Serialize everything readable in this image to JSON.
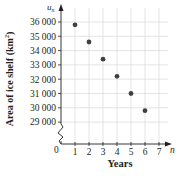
{
  "chart_data": {
    "type": "scatter",
    "title": "",
    "xlabel": "Years",
    "ylabel": "Area of ice shelf (km²)",
    "x_axis_symbol": "n",
    "y_axis_symbol": "u_n",
    "x": [
      1,
      2,
      3,
      4,
      5,
      6
    ],
    "values": [
      35800,
      34600,
      33400,
      32200,
      31000,
      29800
    ],
    "x_ticks": [
      0,
      1,
      2,
      3,
      4,
      5,
      6,
      7
    ],
    "y_ticks": [
      29000,
      30000,
      31000,
      32000,
      33000,
      34000,
      35000,
      36000
    ],
    "y_tick_labels": [
      "29 000",
      "30 000",
      "31 000",
      "32 000",
      "33 000",
      "34 000",
      "35 000",
      "36 000"
    ],
    "xlim": [
      0,
      7
    ],
    "ylim": [
      29000,
      36000
    ],
    "y_axis_break": true,
    "grid": true,
    "colors": {
      "point": "#404040",
      "grid": "#d9d9d9",
      "axis": "#231f20"
    }
  },
  "labels": {
    "ylabel_text": "Area of ice shelf (km",
    "ylabel_sup": "2",
    "ylabel_close": ")",
    "xlabel": "Years",
    "x_symbol": "n",
    "y_symbol": "u",
    "y_symbol_sub": "n",
    "origin": "0"
  }
}
